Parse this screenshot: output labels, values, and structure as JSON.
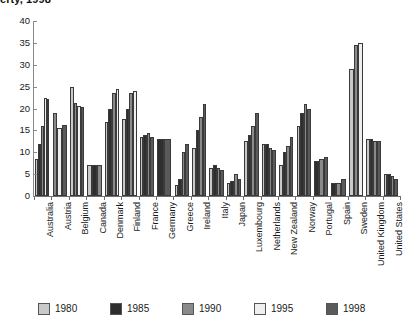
{
  "chart_data": {
    "type": "bar",
    "title": "erty, 1998",
    "xlabel": "",
    "ylabel": "",
    "ylim": [
      0,
      40
    ],
    "ytick_step": 5,
    "yticks": [
      0,
      5,
      10,
      15,
      20,
      25,
      30,
      35,
      40
    ],
    "grid": false,
    "legend_position": "bottom",
    "categories": [
      "Australia",
      "Austria",
      "Belgium",
      "Canada",
      "Denmark",
      "Finland",
      "France",
      "Germany",
      "Greece",
      "Ireland",
      "Italy",
      "Japan",
      "Luxembourg",
      "Netherlands",
      "New Zealand",
      "Norway",
      "Portugal",
      "Spain",
      "Sweden",
      "United Kingdom",
      "United States"
    ],
    "series": [
      {
        "name": "1980",
        "color": "#c9c9c9",
        "values": [
          8.5,
          null,
          25.0,
          7.0,
          17.0,
          17.5,
          13.5,
          null,
          2.5,
          11.0,
          6.5,
          3.0,
          12.5,
          12.0,
          7.0,
          16.0,
          null,
          null,
          29.0,
          13.0,
          5.0
        ]
      },
      {
        "name": "1985",
        "color": "#2e2e2e",
        "values": [
          12.0,
          null,
          null,
          7.0,
          20.0,
          20.0,
          14.0,
          13.0,
          4.0,
          15.0,
          7.0,
          3.5,
          14.0,
          12.0,
          10.0,
          19.0,
          8.0,
          3.0,
          null,
          13.0,
          5.0
        ]
      },
      {
        "name": "1990",
        "color": "#8a8a8a",
        "values": [
          16.0,
          19.0,
          21.3,
          7.0,
          23.5,
          23.5,
          14.5,
          null,
          10.0,
          18.0,
          6.5,
          5.0,
          16.0,
          11.0,
          11.5,
          21.0,
          8.5,
          3.0,
          34.5,
          12.5,
          4.5
        ]
      },
      {
        "name": "1995",
        "color": "#efefef",
        "values": [
          22.3,
          15.5,
          20.5,
          null,
          24.5,
          24.0,
          null,
          null,
          null,
          null,
          null,
          null,
          null,
          null,
          null,
          null,
          null,
          null,
          35.0,
          null,
          null
        ]
      },
      {
        "name": "1998",
        "color": "#5a5a5a",
        "values": [
          22.2,
          16.3,
          20.3,
          null,
          null,
          null,
          13.5,
          13.0,
          12.0,
          21.0,
          6.0,
          4.0,
          19.0,
          10.5,
          13.5,
          20.0,
          9.0,
          4.0,
          null,
          12.5,
          4.0
        ]
      }
    ]
  }
}
